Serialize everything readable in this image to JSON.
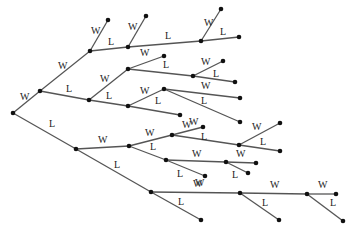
{
  "diagram": {
    "type": "tree",
    "title": "",
    "nodes": {
      "root": [
        13,
        113
      ],
      "a": [
        40,
        91
      ],
      "b": [
        90,
        51
      ],
      "b_w": [
        108,
        20
      ],
      "c": [
        128,
        47
      ],
      "c_w": [
        146,
        16
      ],
      "d": [
        201,
        41
      ],
      "d_w": [
        221,
        9
      ],
      "d_l": [
        239,
        37
      ],
      "e": [
        89,
        100
      ],
      "f": [
        128,
        69
      ],
      "f_w": [
        164,
        56
      ],
      "g": [
        193,
        76
      ],
      "g_w": [
        223,
        61
      ],
      "g_l": [
        235,
        82
      ],
      "h": [
        128,
        106
      ],
      "i": [
        164,
        89
      ],
      "i_w": [
        240,
        98
      ],
      "i_l": [
        240,
        122
      ],
      "h_l": [
        180,
        115
      ],
      "j": [
        76,
        149
      ],
      "k": [
        129,
        146
      ],
      "m": [
        172,
        135
      ],
      "m_w": [
        203,
        127
      ],
      "n": [
        239,
        145
      ],
      "n_w": [
        280,
        123
      ],
      "n_l": [
        280,
        151
      ],
      "o": [
        166,
        160
      ],
      "p": [
        226,
        162
      ],
      "p_w": [
        256,
        163
      ],
      "p_l": [
        248,
        173
      ],
      "o_l": [
        205,
        176
      ],
      "q": [
        151,
        192
      ],
      "r": [
        240,
        193
      ],
      "r_l": [
        279,
        220
      ],
      "s": [
        307,
        194
      ],
      "s_w": [
        336,
        194
      ],
      "s_l": [
        343,
        221
      ],
      "q_l": [
        201,
        220
      ]
    },
    "edges": [
      {
        "from": "root",
        "to": "a",
        "label": "W",
        "lx": 20,
        "ly": 100
      },
      {
        "from": "a",
        "to": "b",
        "label": "W",
        "lx": 58,
        "ly": 69
      },
      {
        "from": "b",
        "to": "b_w",
        "label": "W",
        "lx": 91,
        "ly": 34
      },
      {
        "from": "b",
        "to": "c",
        "label": "L",
        "lx": 108,
        "ly": 45
      },
      {
        "from": "c",
        "to": "c_w",
        "label": "W",
        "lx": 128,
        "ly": 30
      },
      {
        "from": "c",
        "to": "d",
        "label": "L",
        "lx": 165,
        "ly": 39
      },
      {
        "from": "d",
        "to": "d_w",
        "label": "W",
        "lx": 204,
        "ly": 26
      },
      {
        "from": "d",
        "to": "d_l",
        "label": "L",
        "lx": 220,
        "ly": 35
      },
      {
        "from": "a",
        "to": "e",
        "label": "L",
        "lx": 66,
        "ly": 92
      },
      {
        "from": "e",
        "to": "f",
        "label": "W",
        "lx": 100,
        "ly": 82
      },
      {
        "from": "f",
        "to": "f_w",
        "label": "W",
        "lx": 140,
        "ly": 56
      },
      {
        "from": "f",
        "to": "g",
        "label": "L",
        "lx": 163,
        "ly": 68
      },
      {
        "from": "g",
        "to": "g_w",
        "label": "W",
        "lx": 201,
        "ly": 65
      },
      {
        "from": "g",
        "to": "g_l",
        "label": "L",
        "lx": 213,
        "ly": 77
      },
      {
        "from": "e",
        "to": "h",
        "label": "L",
        "lx": 106,
        "ly": 99
      },
      {
        "from": "h",
        "to": "i",
        "label": "W",
        "lx": 140,
        "ly": 94
      },
      {
        "from": "i",
        "to": "i_w",
        "label": "W",
        "lx": 201,
        "ly": 89
      },
      {
        "from": "i",
        "to": "i_l",
        "label": "L",
        "lx": 201,
        "ly": 104
      },
      {
        "from": "h",
        "to": "h_l",
        "label": "L",
        "lx": 155,
        "ly": 104
      },
      {
        "from": "root",
        "to": "j",
        "label": "L",
        "lx": 49,
        "ly": 127
      },
      {
        "from": "j",
        "to": "k",
        "label": "W",
        "lx": 98,
        "ly": 143
      },
      {
        "from": "k",
        "to": "m",
        "label": "W",
        "lx": 145,
        "ly": 136
      },
      {
        "from": "m",
        "to": "m_w",
        "label": "W",
        "lx": 182,
        "ly": 128
      },
      {
        "from": "m",
        "to": "n",
        "label": "L",
        "lx": 201,
        "ly": 140
      },
      {
        "from": "n",
        "to": "n_w",
        "label": "W",
        "lx": 252,
        "ly": 130
      },
      {
        "from": "n",
        "to": "n_l",
        "label": "L",
        "lx": 260,
        "ly": 145
      },
      {
        "from": "k",
        "to": "o",
        "label": "L",
        "lx": 150,
        "ly": 150
      },
      {
        "from": "o",
        "to": "p",
        "label": "W",
        "lx": 192,
        "ly": 157
      },
      {
        "from": "p",
        "to": "p_w",
        "label": "W",
        "lx": 236,
        "ly": 157
      },
      {
        "from": "p",
        "to": "p_l",
        "label": "L",
        "lx": 232,
        "ly": 178
      },
      {
        "from": "o",
        "to": "o_l",
        "label": "L",
        "lx": 177,
        "ly": 177
      },
      {
        "from": "j",
        "to": "q",
        "label": "L",
        "lx": 114,
        "ly": 168
      },
      {
        "from": "q",
        "to": "r",
        "label": "W",
        "lx": 193,
        "ly": 187
      },
      {
        "from": "q",
        "to": "q_l",
        "label": "L",
        "lx": 178,
        "ly": 205
      },
      {
        "from": "r",
        "to": "r",
        "label": "",
        "lx": 0,
        "ly": 0
      },
      {
        "from": "r",
        "to": "s",
        "label": "W",
        "lx": 270,
        "ly": 188
      },
      {
        "from": "r",
        "to": "r_l",
        "label": "L",
        "lx": 262,
        "ly": 206
      },
      {
        "from": "s",
        "to": "s_w",
        "label": "W",
        "lx": 318,
        "ly": 188
      },
      {
        "from": "s",
        "to": "s_l",
        "label": "L",
        "lx": 330,
        "ly": 206
      }
    ],
    "extra_labels": [
      {
        "text": "W",
        "x": 189,
        "y": 125
      },
      {
        "text": "W",
        "x": 195,
        "y": 186
      }
    ]
  }
}
